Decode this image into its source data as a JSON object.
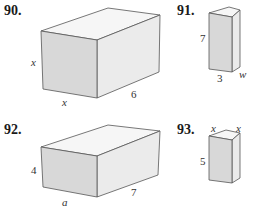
{
  "problems": [
    {
      "number": "90.",
      "labels": {
        "height": "x",
        "width": "x",
        "depth": "6"
      },
      "italic": {
        "height": true,
        "width": true,
        "depth": false
      }
    },
    {
      "number": "91.",
      "labels": {
        "height": "7",
        "width": "3",
        "depth": "w"
      },
      "italic": {
        "height": false,
        "width": false,
        "depth": true
      }
    },
    {
      "number": "92.",
      "labels": {
        "height": "4",
        "width": "a",
        "depth": "7"
      },
      "italic": {
        "height": false,
        "width": true,
        "depth": false
      }
    },
    {
      "number": "93.",
      "labels": {
        "height": "5",
        "width": "x",
        "depth": "x"
      },
      "italic": {
        "height": false,
        "width": true,
        "depth": true
      }
    }
  ],
  "colors": {
    "front_face": "#d6d6d6",
    "side_face": "#e8e8e8",
    "top_face": "#f6f6f6",
    "edge": "#555555"
  }
}
